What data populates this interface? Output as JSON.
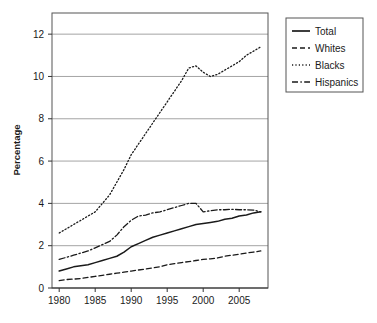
{
  "chart_data": {
    "type": "line",
    "title": "",
    "xlabel": "",
    "ylabel": "Percentage",
    "xlim": [
      1979,
      2009
    ],
    "ylim": [
      0,
      13
    ],
    "yticks": [
      0,
      2,
      4,
      6,
      8,
      10,
      12
    ],
    "ytick_labels": [
      "0",
      "2",
      "4",
      "6",
      "8",
      "10",
      "12"
    ],
    "xticks": [
      1980,
      1985,
      1990,
      1995,
      2000,
      2005
    ],
    "xtick_labels": [
      "1980",
      "1985",
      "1990",
      "1995",
      "2000",
      "2005"
    ],
    "grid": "horizontal",
    "legend_position": "right-top",
    "x": [
      1980,
      1981,
      1982,
      1983,
      1984,
      1985,
      1986,
      1987,
      1988,
      1989,
      1990,
      1991,
      1992,
      1993,
      1994,
      1995,
      1996,
      1997,
      1998,
      1999,
      2000,
      2001,
      2002,
      2003,
      2004,
      2005,
      2006,
      2007,
      2008
    ],
    "series": [
      {
        "name": "Total",
        "style": "solid",
        "color": "#1a1a1a",
        "values": [
          0.8,
          0.9,
          1.0,
          1.05,
          1.1,
          1.2,
          1.3,
          1.4,
          1.5,
          1.7,
          1.95,
          2.1,
          2.25,
          2.4,
          2.5,
          2.6,
          2.7,
          2.8,
          2.9,
          3.0,
          3.05,
          3.1,
          3.15,
          3.25,
          3.3,
          3.4,
          3.45,
          3.55,
          3.6
        ]
      },
      {
        "name": "Whites",
        "style": "dashed",
        "color": "#1a1a1a",
        "values": [
          0.35,
          0.4,
          0.42,
          0.45,
          0.5,
          0.55,
          0.6,
          0.65,
          0.7,
          0.75,
          0.8,
          0.85,
          0.9,
          0.95,
          1.0,
          1.1,
          1.15,
          1.2,
          1.25,
          1.3,
          1.35,
          1.38,
          1.42,
          1.5,
          1.55,
          1.6,
          1.65,
          1.7,
          1.75
        ]
      },
      {
        "name": "Blacks",
        "style": "dotted",
        "color": "#1a1a1a",
        "values": [
          2.6,
          2.8,
          3.0,
          3.2,
          3.4,
          3.6,
          4.0,
          4.4,
          5.0,
          5.6,
          6.3,
          6.8,
          7.3,
          7.8,
          8.3,
          8.8,
          9.3,
          9.8,
          10.4,
          10.5,
          10.2,
          10.0,
          10.1,
          10.3,
          10.5,
          10.7,
          11.0,
          11.2,
          11.4
        ]
      },
      {
        "name": "Hispanics",
        "style": "dashdot",
        "color": "#1a1a1a",
        "values": [
          1.35,
          1.45,
          1.55,
          1.65,
          1.75,
          1.9,
          2.05,
          2.2,
          2.5,
          2.9,
          3.2,
          3.4,
          3.45,
          3.55,
          3.6,
          3.7,
          3.8,
          3.9,
          4.0,
          4.0,
          3.6,
          3.65,
          3.7,
          3.7,
          3.72,
          3.7,
          3.7,
          3.68,
          3.6
        ]
      }
    ]
  },
  "legend": {
    "entries": [
      {
        "label": "Total"
      },
      {
        "label": "Whites"
      },
      {
        "label": "Blacks"
      },
      {
        "label": "Hispanics"
      }
    ]
  }
}
